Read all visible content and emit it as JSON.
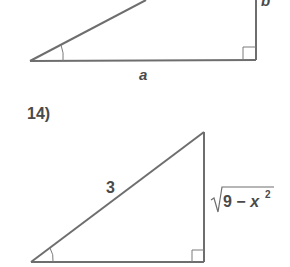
{
  "colors": {
    "stroke": "#6e6e6e",
    "text": "#4a4a4a",
    "background": "#ffffff"
  },
  "problem_13_partial": {
    "adjacent_label": "a",
    "opposite_label": "b"
  },
  "problem_14": {
    "number_label": "14)",
    "hypotenuse_label": "3",
    "opposite_label_radicand": "9 − x",
    "opposite_label_exponent": "2"
  }
}
